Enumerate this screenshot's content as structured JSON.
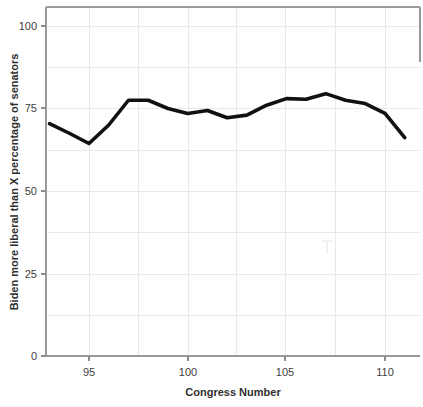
{
  "chart_data": {
    "type": "line",
    "title": "",
    "subtitle": "",
    "xlabel": "Congress Number",
    "ylabel": "Biden more liberal than X percentage of senators",
    "xlim": [
      92.6,
      111.6
    ],
    "ylim": [
      0,
      104
    ],
    "xticks": [
      95,
      100,
      105,
      110
    ],
    "xtick_labels": [
      "95",
      "100",
      "105",
      "110"
    ],
    "yticks": [
      0,
      25,
      50,
      75,
      100
    ],
    "ytick_labels": [
      "0",
      "25",
      "50",
      "75",
      "100"
    ],
    "grid": true,
    "legend": "none",
    "line_color": "#111111",
    "x": [
      93,
      94,
      95,
      96,
      97,
      98,
      99,
      100,
      101,
      102,
      103,
      104,
      105,
      106,
      107,
      108,
      109,
      110,
      111
    ],
    "series": [
      {
        "name": "Biden more liberal than X percentage of senators",
        "values": [
          70.4,
          67.5,
          64.4,
          70.0,
          77.5,
          77.5,
          75.0,
          73.5,
          74.4,
          72.2,
          73.0,
          76.0,
          78.0,
          77.8,
          79.5,
          77.5,
          76.5,
          73.5,
          66.2
        ]
      }
    ]
  },
  "axes": {
    "y_label": "Biden more liberal than X percentage of senators",
    "x_label": "Congress Number",
    "y_ticks": [
      {
        "label": "100",
        "value": 100
      },
      {
        "label": "75",
        "value": 75
      },
      {
        "label": "50",
        "value": 50
      },
      {
        "label": "25",
        "value": 25
      },
      {
        "label": "0",
        "value": 0
      }
    ],
    "x_ticks": [
      {
        "label": "95",
        "value": 95
      },
      {
        "label": "100",
        "value": 100
      },
      {
        "label": "105",
        "value": 105
      },
      {
        "label": "110",
        "value": 110
      }
    ]
  }
}
